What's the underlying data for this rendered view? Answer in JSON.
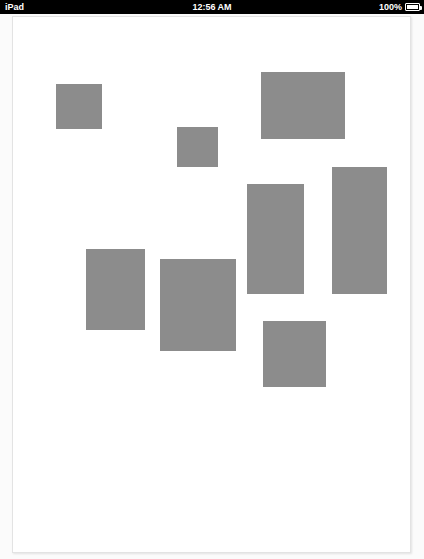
{
  "status_bar": {
    "device_label": "iPad",
    "time": "12:56 AM",
    "battery_percent": "100%",
    "battery_icon": "battery-full-icon",
    "background_color": "#000000",
    "text_color": "#ffffff"
  },
  "document": {
    "page_background_color": "#ffffff",
    "page_border_color": "#e3e3e3",
    "viewport_background_color": "#fbfbfb",
    "block_fill_color": "#8c8c8c",
    "block_count": 8,
    "blocks": [
      {
        "id": "block-1",
        "x": 43,
        "y": 67,
        "width": 46,
        "height": 45
      },
      {
        "id": "block-2",
        "x": 164,
        "y": 110,
        "width": 41,
        "height": 40
      },
      {
        "id": "block-3",
        "x": 248,
        "y": 55,
        "width": 84,
        "height": 67
      },
      {
        "id": "block-4",
        "x": 319,
        "y": 150,
        "width": 55,
        "height": 127
      },
      {
        "id": "block-5",
        "x": 234,
        "y": 167,
        "width": 57,
        "height": 110
      },
      {
        "id": "block-6",
        "x": 73,
        "y": 232,
        "width": 59,
        "height": 81
      },
      {
        "id": "block-7",
        "x": 147,
        "y": 242,
        "width": 76,
        "height": 92
      },
      {
        "id": "block-8",
        "x": 250,
        "y": 304,
        "width": 63,
        "height": 66
      }
    ]
  }
}
